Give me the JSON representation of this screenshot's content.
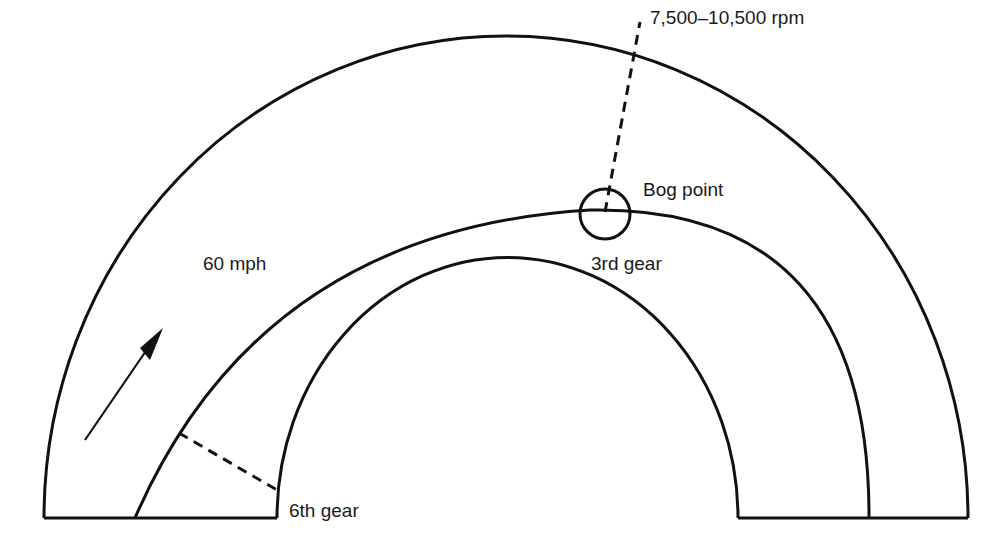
{
  "diagram": {
    "type": "race-track turn diagram",
    "colors": {
      "line": "#111111",
      "text": "#1a1a1a",
      "background": "#ffffff"
    },
    "labels": {
      "rpm_range": "7,500–10,500 rpm",
      "bog_point": "Bog point",
      "third_gear": "3rd gear",
      "speed": "60 mph",
      "sixth_gear": "6th gear"
    },
    "icons": {
      "direction_arrow": "arrow-up-right-icon",
      "bog_marker": "circle-marker-icon"
    }
  }
}
